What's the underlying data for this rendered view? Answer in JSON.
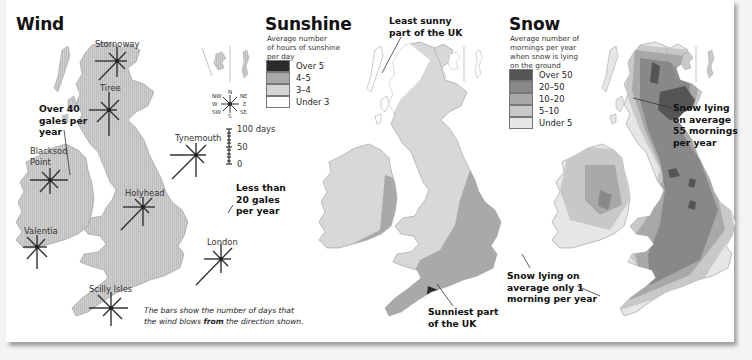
{
  "wind": {
    "title": "Wind",
    "stations": [
      "Stornoway",
      "Tiree",
      "Tynemouth",
      "Blacksod Point",
      "Holyhead",
      "Valentia",
      "London",
      "Scilly Isles"
    ],
    "notes": {
      "over40_l1": "Over 40",
      "over40_l2": "gales per",
      "over40_l3": "year",
      "less20_l1": "Less than",
      "less20_l2": "20 gales",
      "less20_l3": "per year"
    },
    "compass": {
      "n": "N",
      "ne": "NE",
      "e": "E",
      "se": "SE",
      "s": "S",
      "sw": "SW",
      "w": "W",
      "nw": "NW"
    },
    "scale": {
      "top": "100 days",
      "mid": "50",
      "bottom": "0"
    },
    "caption": {
      "line1": "The bars show the number of days that",
      "line2_pre": "the wind blows ",
      "line2_bold": "from",
      "line2_post": " the direction shown."
    }
  },
  "sunshine": {
    "title": "Sunshine",
    "subtitle_l1": "Average number",
    "subtitle_l2": "of hours of sunshine",
    "subtitle_l3": "per day",
    "legend": [
      {
        "label": "Over 5",
        "color": "#2a2a2a"
      },
      {
        "label": "4–5",
        "color": "#a9a9a9"
      },
      {
        "label": "3–4",
        "color": "#d6d6d6"
      },
      {
        "label": "Under 3",
        "color": "#ffffff"
      }
    ],
    "notes": {
      "least_l1": "Least sunny",
      "least_l2": "part of the UK",
      "sunniest_l1": "Sunniest part",
      "sunniest_l2": "of the UK"
    }
  },
  "snow": {
    "title": "Snow",
    "subtitle_l1": "Average number of",
    "subtitle_l2": "mornings per year",
    "subtitle_l3": "when snow is lying",
    "subtitle_l4": "on the ground",
    "legend": [
      {
        "label": "Over 50",
        "color": "#555555"
      },
      {
        "label": "20–50",
        "color": "#888888"
      },
      {
        "label": "10–20",
        "color": "#a8a8a8"
      },
      {
        "label": "5–10",
        "color": "#c8c8c8"
      },
      {
        "label": "Under 5",
        "color": "#e6e6e6"
      }
    ],
    "notes": {
      "most_l1": "Snow lying",
      "most_l2": "on average",
      "most_l3": "55 mornings",
      "most_l4": "per year",
      "least_l1": "Snow lying on",
      "least_l2": "average only 1",
      "least_l3": "morning per year"
    }
  },
  "colors": {
    "land": "#c9c9c9",
    "land_stroke": "#9a9a9a",
    "ink": "#111111"
  }
}
